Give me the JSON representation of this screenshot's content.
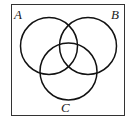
{
  "diagram": {
    "type": "venn",
    "sets": [
      {
        "id": "A",
        "label": "A"
      },
      {
        "id": "B",
        "label": "B"
      },
      {
        "id": "C",
        "label": "C"
      }
    ],
    "universe_box": true
  }
}
